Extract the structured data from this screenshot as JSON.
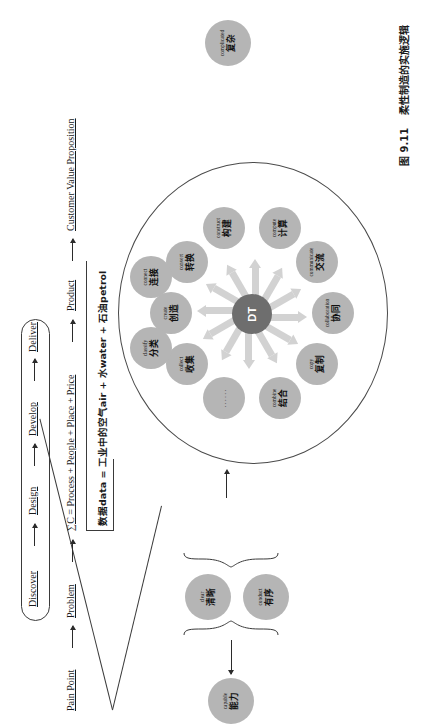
{
  "figure": {
    "caption_number": "图 9.11",
    "caption_title": "柔性制造的实施逻辑"
  },
  "flow": {
    "phase_row": {
      "items": [
        "Discover",
        "Design",
        "Develop",
        "Deliver"
      ],
      "arrow": "→"
    },
    "value_row": {
      "items": [
        "Pain Point",
        "Problem",
        "∑C = Process + People + Place + Price",
        "Product",
        "Customer Value Proposition"
      ],
      "arrow": "→"
    },
    "formula": "数据data = 工业中的空气air + 水water + 石油petrol"
  },
  "core": {
    "label": "DT"
  },
  "ring_nodes": [
    {
      "en": "create",
      "cn": "创造"
    },
    {
      "en": "convert",
      "cn": "转换"
    },
    {
      "en": "construct",
      "cn": "构建"
    },
    {
      "en": "compute",
      "cn": "计算"
    },
    {
      "en": "communicate",
      "cn": "交流"
    },
    {
      "en": "collaboration",
      "cn": "协同"
    },
    {
      "en": "copy",
      "cn": "复制"
    },
    {
      "en": "combine",
      "cn": "结合"
    },
    {
      "en": "",
      "cn": "",
      "ellipsis": "......"
    },
    {
      "en": "collect",
      "cn": "收集"
    },
    {
      "en": "classify",
      "cn": "分类"
    },
    {
      "en": "connect",
      "cn": "连接"
    }
  ],
  "outcome_nodes": {
    "input": {
      "en": "complicated",
      "cn": "复杂"
    },
    "pair": [
      {
        "en": "clear",
        "cn": "清晰"
      },
      {
        "en": "conduct",
        "cn": "有序"
      }
    ],
    "capable": {
      "en": "capable",
      "cn": "能力"
    },
    "confidence": {
      "en": "confidence",
      "cn": "信心"
    }
  },
  "colors": {
    "node_fill": "#b5b5b5",
    "core_fill": "#6e6e6e",
    "ray_fill": "#d2d2d2",
    "stroke": "#3a3a3a"
  }
}
